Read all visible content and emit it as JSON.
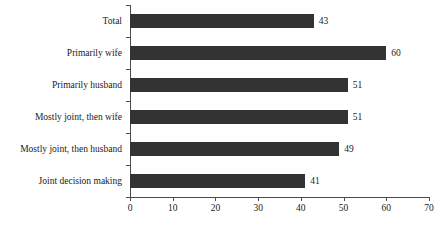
{
  "chart_data": {
    "type": "bar",
    "orientation": "horizontal",
    "title": "",
    "subtitle": "",
    "xlabel": "",
    "ylabel": "",
    "categories": [
      "Total",
      "Primarily wife",
      "Primarily husband",
      "Mostly joint, then wife",
      "Mostly joint, then husband",
      "Joint decision making"
    ],
    "values": [
      43,
      60,
      51,
      51,
      49,
      41
    ],
    "value_labels": [
      "43",
      "60",
      "51",
      "51",
      "49",
      "41"
    ],
    "xlim": [
      0,
      70
    ],
    "xticks": [
      0,
      10,
      20,
      30,
      40,
      50,
      60,
      70
    ],
    "xtick_labels": [
      "0",
      "10",
      "20",
      "30",
      "40",
      "50",
      "60",
      "70"
    ],
    "grid": false,
    "legend": false,
    "legend_position": "none",
    "bar_color": "#333333",
    "axis_color": "#4c4c4c",
    "background_color": "#ffffff",
    "data_labels_shown": true
  }
}
